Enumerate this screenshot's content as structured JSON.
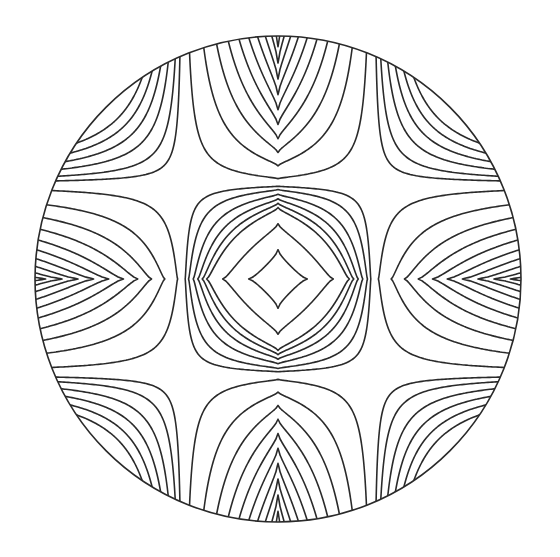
{
  "figure": {
    "title": "Concentric astroid contour pattern",
    "canvas": {
      "width": 560,
      "height": 557,
      "background": "#ffffff"
    },
    "stroke_color": "#2a2a2a",
    "circle": {
      "cx": 278,
      "cy": 279,
      "r": 243
    },
    "field": {
      "formula": "|x|^(2/3) + |y|^(2/3) - alpha*|x*y|^(2/3)",
      "alpha": 0.048,
      "levels": [
        9.5,
        14.5,
        17.2,
        17.9,
        18.6,
        19.3,
        20.0,
        20.5,
        21.6,
        23.4,
        25.2,
        27.0,
        28.8,
        30.6,
        32.4,
        34.2,
        36.0,
        37.8
      ],
      "grid_step": 2
    },
    "astroid_cusps_px": [
      55,
      93,
      154
    ]
  }
}
